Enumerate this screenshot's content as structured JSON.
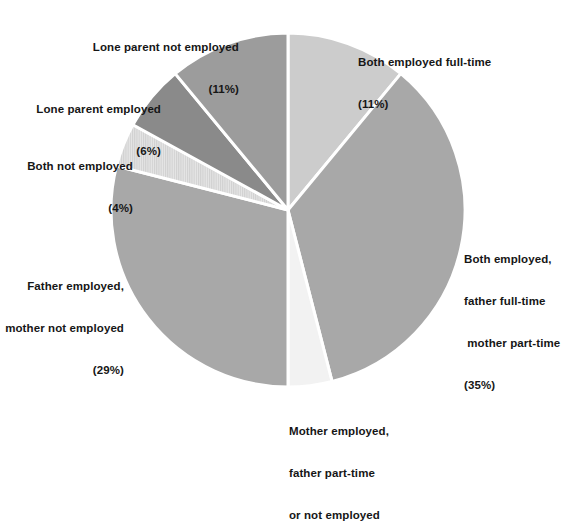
{
  "chart_data": {
    "type": "pie",
    "title": "",
    "subtitle": "",
    "xlabel": "",
    "ylabel": "",
    "legend_position": "none",
    "grid": false,
    "start_angle_deg": 0,
    "direction": "clockwise",
    "categories": [
      "Both employed full-time",
      "Both employed, father full-time mother part-time",
      "Mother employed, father part-time or not employed",
      "Father employed, mother not employed",
      "Both not employed",
      "Lone parent employed",
      "Lone parent not employed"
    ],
    "values": [
      11,
      35,
      4,
      29,
      4,
      6,
      11
    ],
    "value_labels": [
      "(11%)",
      "(35%)",
      "",
      "(29%)",
      "(4%)",
      "(6%)",
      "(11%)"
    ],
    "colors": [
      "#cccccc",
      "#a8a8a8",
      "#f2f2f2",
      "#a8a8a8",
      "#d9d9d9",
      "#8a8a8a",
      "#9c9c9c"
    ],
    "slice_textures": [
      "solid",
      "solid",
      "solid",
      "solid",
      "vertical-stripes",
      "solid",
      "solid"
    ],
    "slice_border_color": "#ffffff",
    "units": "percent"
  },
  "labels": {
    "both_full_time": {
      "line1": "Both employed full-time",
      "line2": "(11%)"
    },
    "both_father_full_mother_part": {
      "line1": "Both employed,",
      "line2": "father full-time",
      "line3": " mother part-time",
      "line4": "(35%)"
    },
    "mother_employed_father_part": {
      "line1": "Mother employed,",
      "line2": "father part-time",
      "line3": "or not employed"
    },
    "father_employed_mother_not": {
      "line1": "Father employed,",
      "line2": "mother not employed",
      "line3": "(29%)"
    },
    "both_not_employed": {
      "line1": "Both not employed",
      "line2": "(4%)"
    },
    "lone_parent_employed": {
      "line1": "Lone parent employed",
      "line2": "(6%)"
    },
    "lone_parent_not_employed": {
      "line1": "Lone parent not employed",
      "line2": "(11%)"
    }
  },
  "geometry": {
    "center_x": 288,
    "center_y": 210,
    "radius": 177
  }
}
